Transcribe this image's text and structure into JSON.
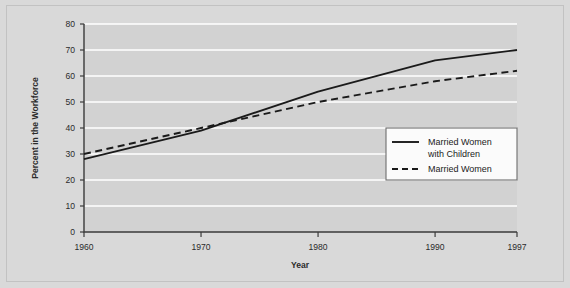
{
  "chart_data": {
    "type": "line",
    "title": "",
    "xlabel": "Year",
    "ylabel": "Percent in the Workforce",
    "x": [
      1960,
      1970,
      1980,
      1990,
      1997
    ],
    "xticklabels": [
      "1960",
      "1970",
      "1980",
      "1990",
      "1997"
    ],
    "xlim": [
      1960,
      1997
    ],
    "ylim": [
      0,
      80
    ],
    "yticks": [
      0,
      10,
      20,
      30,
      40,
      50,
      60,
      70,
      80
    ],
    "yticklabels": [
      "0",
      "10",
      "20",
      "30",
      "40",
      "50",
      "60",
      "70",
      "80"
    ],
    "grid": "horizontal-white",
    "legend_position": "inside-right-middle",
    "series": [
      {
        "name": "Married Women with Children",
        "style": "solid",
        "values": [
          28,
          39,
          54,
          66,
          70
        ]
      },
      {
        "name": "Married Women",
        "style": "dashed",
        "values": [
          30,
          40,
          50,
          58,
          62
        ]
      }
    ],
    "legend": [
      {
        "label_line1": "Married Women",
        "label_line2": "with Children",
        "style": "solid"
      },
      {
        "label_line1": "Married Women",
        "label_line2": "",
        "style": "dashed"
      }
    ],
    "colors": {
      "line": "#1a1a1a",
      "plot_background": "#d2d2d2",
      "figure_background": "#d9d9d9",
      "gridline": "#ffffff",
      "axis": "#3b3b3b",
      "legend_background": "#fbfbfb"
    }
  }
}
